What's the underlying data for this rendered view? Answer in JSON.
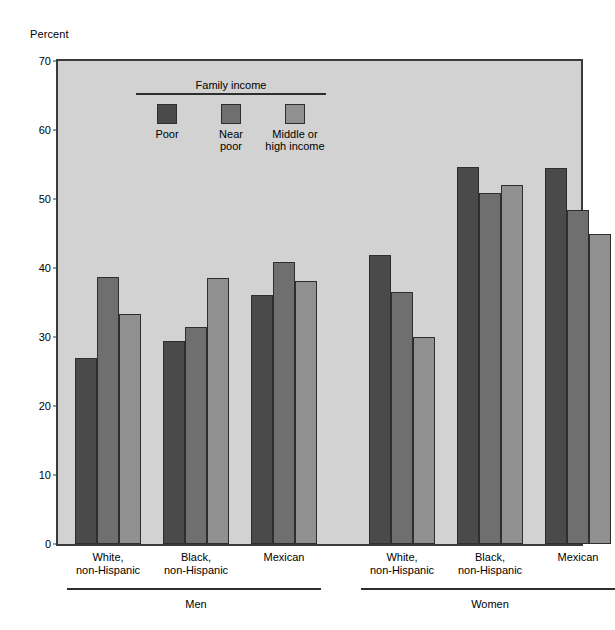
{
  "chart_data": {
    "type": "bar",
    "title": "",
    "ylabel": "Percent",
    "xlabel": "",
    "ylim": [
      0,
      70
    ],
    "yticks": [
      0,
      10,
      20,
      30,
      40,
      50,
      60,
      70
    ],
    "grid": false,
    "legend": {
      "title": "Family income",
      "position": "inside-top-left",
      "entries": [
        {
          "name": "Poor",
          "color": "#4a4a4a"
        },
        {
          "name": "Near\npoor",
          "color": "#6f6f6f"
        },
        {
          "name": "Middle or\nhigh income",
          "color": "#909090"
        }
      ]
    },
    "series": [
      {
        "name": "Poor",
        "color": "#4a4a4a",
        "values": [
          27.0,
          29.4,
          36.1,
          41.9,
          54.7,
          54.5
        ]
      },
      {
        "name": "Near poor",
        "color": "#6f6f6f",
        "values": [
          38.7,
          31.5,
          40.8,
          36.5,
          50.8,
          48.4
        ]
      },
      {
        "name": "Middle or high income",
        "color": "#909090",
        "values": [
          33.4,
          38.5,
          38.1,
          30.0,
          52.1,
          44.9
        ]
      }
    ],
    "categories": [
      "White,\nnon-Hispanic",
      "Black,\nnon-Hispanic",
      "Mexican",
      "White,\nnon-Hispanic",
      "Black,\nnon-Hispanic",
      "Mexican"
    ],
    "supergroups": [
      {
        "label": "Men",
        "categories": [
          0,
          1,
          2
        ]
      },
      {
        "label": "Women",
        "categories": [
          3,
          4,
          5
        ]
      }
    ],
    "colors": {
      "plot_background": "#d2d2d2",
      "page_background": "#ffffff",
      "axis": "#3a3a3a",
      "bar_outline": "#2e2e2e"
    }
  }
}
